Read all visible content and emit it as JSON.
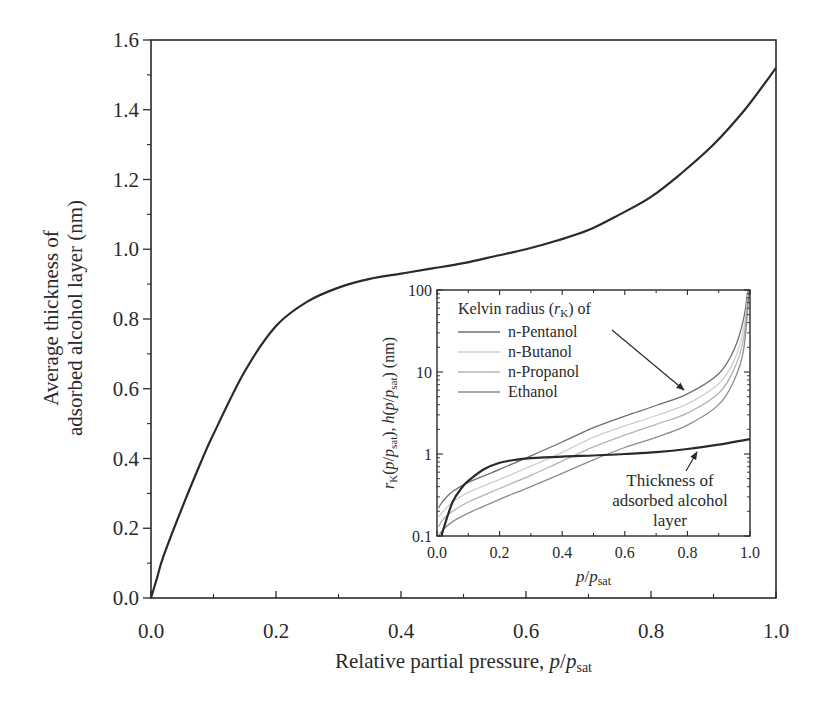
{
  "chart_data": [
    {
      "type": "line",
      "role": "main",
      "title": "",
      "xlabel": "Relative partial pressure, p/p_sat",
      "xlabel_parts": {
        "text": "Relative partial pressure, ",
        "var": "p",
        "slash": "/",
        "var2": "p",
        "sub": "sat"
      },
      "ylabel": "Average thickness of adsorbed alcohol layer (nm)",
      "ylabel_lines": [
        "Average thickness of",
        "adsorbed alcohol layer (nm)"
      ],
      "xlim": [
        0.0,
        1.0
      ],
      "ylim": [
        0.0,
        1.6
      ],
      "xticks": [
        "0.0",
        "0.2",
        "0.4",
        "0.6",
        "0.8",
        "1.0"
      ],
      "yticks": [
        "0.0",
        "0.2",
        "0.4",
        "0.6",
        "0.8",
        "1.0",
        "1.2",
        "1.4",
        "1.6"
      ],
      "grid": false,
      "series": [
        {
          "name": "Average thickness of adsorbed alcohol layer",
          "color": "#2a2a2a",
          "x": [
            0.0,
            0.01,
            0.02,
            0.05,
            0.08,
            0.1,
            0.15,
            0.2,
            0.25,
            0.3,
            0.35,
            0.4,
            0.45,
            0.5,
            0.55,
            0.6,
            0.65,
            0.7,
            0.75,
            0.8,
            0.85,
            0.9,
            0.95,
            1.0
          ],
          "y": [
            0.0,
            0.06,
            0.12,
            0.26,
            0.39,
            0.47,
            0.65,
            0.78,
            0.85,
            0.89,
            0.915,
            0.93,
            0.945,
            0.96,
            0.98,
            1.0,
            1.025,
            1.055,
            1.1,
            1.15,
            1.22,
            1.3,
            1.4,
            1.52
          ]
        }
      ]
    },
    {
      "type": "line",
      "role": "inset",
      "xlabel": "p/p_sat",
      "xlabel_parts": {
        "var": "p",
        "slash": "/",
        "var2": "p",
        "sub": "sat"
      },
      "ylabel": "r_K(p/p_sat), h(p/p_sat) (nm)",
      "yscale": "log",
      "xlim": [
        0.0,
        1.0
      ],
      "ylim": [
        0.1,
        100
      ],
      "xticks": [
        "0.0",
        "0.2",
        "0.4",
        "0.6",
        "0.8",
        "1.0"
      ],
      "yticks": [
        "0.1",
        "1",
        "10",
        "100"
      ],
      "legend_title": "Kelvin radius (r_K) of",
      "legend_title_parts": {
        "text": "Kelvin radius (",
        "var": "r",
        "sub": "K",
        "tail": ") of"
      },
      "legend_position": "upper left",
      "series": [
        {
          "name": "n-Pentanol",
          "color": "#6e6e6e",
          "x": [
            0.005,
            0.02,
            0.05,
            0.1,
            0.2,
            0.3,
            0.4,
            0.5,
            0.6,
            0.7,
            0.8,
            0.9,
            0.95,
            0.98,
            0.993
          ],
          "y": [
            0.22,
            0.27,
            0.35,
            0.45,
            0.65,
            0.95,
            1.4,
            2.1,
            2.9,
            3.9,
            5.4,
            9.5,
            19,
            45,
            100
          ]
        },
        {
          "name": "n-Butanol",
          "color": "#cfcfcf",
          "x": [
            0.005,
            0.02,
            0.05,
            0.1,
            0.2,
            0.3,
            0.4,
            0.5,
            0.6,
            0.7,
            0.8,
            0.9,
            0.95,
            0.98,
            0.995
          ],
          "y": [
            0.17,
            0.2,
            0.26,
            0.34,
            0.49,
            0.71,
            1.05,
            1.6,
            2.2,
            2.95,
            4.1,
            7.2,
            14,
            34,
            100
          ]
        },
        {
          "name": "n-Propanol",
          "color": "#b4b4b4",
          "x": [
            0.005,
            0.02,
            0.05,
            0.1,
            0.2,
            0.3,
            0.4,
            0.5,
            0.6,
            0.7,
            0.8,
            0.9,
            0.95,
            0.98,
            0.996
          ],
          "y": [
            0.13,
            0.16,
            0.2,
            0.26,
            0.38,
            0.55,
            0.82,
            1.22,
            1.7,
            2.3,
            3.15,
            5.5,
            11,
            26,
            100
          ]
        },
        {
          "name": "Ethanol",
          "color": "#8c8c8c",
          "x": [
            0.005,
            0.02,
            0.05,
            0.1,
            0.2,
            0.3,
            0.4,
            0.5,
            0.6,
            0.7,
            0.8,
            0.9,
            0.95,
            0.98,
            0.997
          ],
          "y": [
            0.1,
            0.12,
            0.15,
            0.19,
            0.28,
            0.4,
            0.58,
            0.85,
            1.2,
            1.6,
            2.25,
            4.0,
            8.0,
            19,
            100
          ]
        },
        {
          "name": "Thickness of adsorbed alcohol layer",
          "color": "#2a2a2a",
          "width": 2.2,
          "x": [
            0.015,
            0.02,
            0.05,
            0.08,
            0.1,
            0.15,
            0.2,
            0.25,
            0.3,
            0.4,
            0.5,
            0.6,
            0.7,
            0.8,
            0.9,
            1.0
          ],
          "y": [
            0.1,
            0.12,
            0.26,
            0.39,
            0.47,
            0.65,
            0.78,
            0.85,
            0.89,
            0.93,
            0.96,
            1.0,
            1.055,
            1.15,
            1.3,
            1.52
          ]
        }
      ],
      "annotations": [
        {
          "text": "Kelvin radius curves",
          "arrow_from": [
            0.58,
            42
          ],
          "arrow_to": [
            0.79,
            6.5
          ]
        },
        {
          "text_lines": [
            "Thickness of",
            "adsorbed alcohol",
            "layer"
          ],
          "arrow_from": [
            0.797,
            0.52
          ],
          "arrow_to": [
            0.835,
            0.87
          ]
        }
      ]
    }
  ]
}
